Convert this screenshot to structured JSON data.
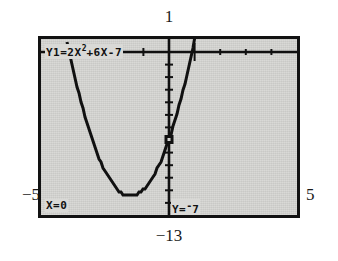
{
  "screen": {
    "device": "graphing-calculator",
    "mode": "trace",
    "equation_label": "Y1=2X²+6X-7",
    "equation_parts": {
      "prefix": "Y1=2X",
      "exponent": "2",
      "suffix": "+6X-7"
    },
    "trace": {
      "x_label_prefix": "X=",
      "x_value": "0",
      "y_label_prefix": "Y=",
      "y_neg_sign": "-",
      "y_value": "7",
      "x_numeric": 0,
      "y_numeric": -7
    }
  },
  "window": {
    "xmin_label": "−5",
    "xmax_label": "5",
    "ymax_label": "1",
    "ymin_label": "−13",
    "xmin": -5,
    "xmax": 5,
    "ymin": -13,
    "ymax": 1,
    "xscl": 1,
    "yscl": 1
  },
  "colors": {
    "screen_background": "#d9d9d6",
    "bezel": "#121212",
    "ink": "#111111",
    "page_background": "#ffffff",
    "label_text": "#1a1a1a"
  },
  "chart_data": {
    "type": "line",
    "xlabel": "",
    "ylabel": "",
    "xlim": [
      -5,
      5
    ],
    "ylim": [
      -13,
      1
    ],
    "grid": false,
    "legend": "none",
    "axis_ticks": {
      "x": [
        -5,
        -4,
        -3,
        -2,
        -1,
        0,
        1,
        2,
        3,
        4,
        5
      ],
      "y": [
        -13,
        -12,
        -11,
        -10,
        -9,
        -8,
        -7,
        -6,
        -5,
        -4,
        -3,
        -2,
        -1,
        0,
        1
      ]
    },
    "series": [
      {
        "name": "Y1=2X²+6X-7",
        "equation": "y = 2x^2 + 6x - 7",
        "x": [
          -5,
          -4.75,
          -4.5,
          -4.25,
          -4,
          -3.75,
          -3.5,
          -3.25,
          -3,
          -2.75,
          -2.5,
          -2.25,
          -2,
          -1.75,
          -1.5,
          -1.25,
          -1,
          -0.75,
          -0.5,
          -0.25,
          0,
          0.25,
          0.5,
          0.75,
          1
        ],
        "values": [
          13,
          7.625,
          6.5,
          4.625,
          1,
          -0.375,
          -3.5,
          -5.375,
          -7,
          -8.375,
          -9.5,
          -10.375,
          -11,
          -11.375,
          -11.5,
          -11.375,
          -11,
          -10.375,
          -9.5,
          -8.375,
          -7,
          -5.375,
          -3.5,
          -1.375,
          1
        ]
      }
    ],
    "annotations": [
      {
        "name": "vertex",
        "x": -1.5,
        "y": -11.5
      },
      {
        "name": "trace-cursor",
        "x": 0,
        "y": -7,
        "label": "X=0  Y=-7"
      }
    ]
  }
}
